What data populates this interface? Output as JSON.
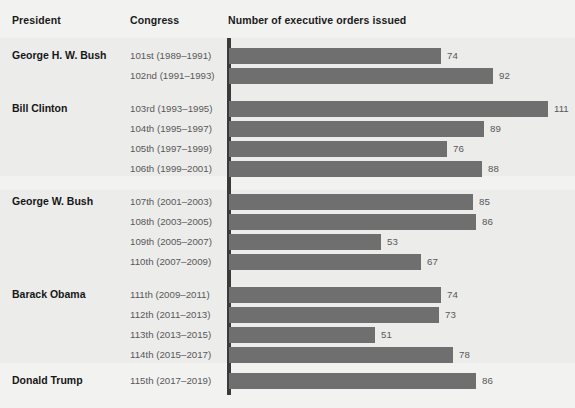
{
  "headers": {
    "president": "President",
    "congress": "Congress",
    "value": "Number of executive orders issued"
  },
  "chart_data": {
    "type": "bar",
    "orientation": "horizontal",
    "title": "Number of executive orders issued",
    "xlabel": "Number of executive orders issued",
    "ylabel": "Congress",
    "xlim": [
      0,
      120
    ],
    "grid": false,
    "legend": null,
    "bar_color": "#6f6f6f",
    "background_color": "#ececeb",
    "axis_color": "#3b3b3b",
    "categories": [
      "101st (1989–1991)",
      "102nd (1991–1993)",
      "103rd (1993–1995)",
      "104th (1995–1997)",
      "105th (1997–1999)",
      "106th (1999–2001)",
      "107th (2001–2003)",
      "108th (2003–2005)",
      "109th (2005–2007)",
      "110th (2007–2009)",
      "111th (2009–2011)",
      "112th (2011–2013)",
      "113th (2013–2015)",
      "114th (2015–2017)",
      "115th (2017–2019)"
    ],
    "values": [
      74,
      92,
      111,
      89,
      76,
      88,
      85,
      86,
      53,
      67,
      74,
      73,
      51,
      78,
      86
    ],
    "groups": [
      {
        "president": "George H. W. Bush",
        "congresses": [
          "101st (1989–1991)",
          "102nd (1991–1993)"
        ],
        "values": [
          74,
          92
        ]
      },
      {
        "president": "Bill Clinton",
        "congresses": [
          "103rd (1993–1995)",
          "104th (1995–1997)",
          "105th (1997–1999)",
          "106th (1999–2001)"
        ],
        "values": [
          111,
          89,
          76,
          88
        ]
      },
      {
        "president": "George W. Bush",
        "congresses": [
          "107th (2001–2003)",
          "108th (2003–2005)",
          "109th (2005–2007)",
          "110th (2007–2009)"
        ],
        "values": [
          85,
          86,
          53,
          67
        ]
      },
      {
        "president": "Barack Obama",
        "congresses": [
          "111th (2009–2011)",
          "112th (2011–2013)",
          "113th (2013–2015)",
          "114th (2015–2017)"
        ],
        "values": [
          74,
          73,
          51,
          78
        ]
      },
      {
        "president": "Donald Trump",
        "congresses": [
          "115th (2017–2019)"
        ],
        "values": [
          86
        ]
      }
    ]
  },
  "rows": [
    {
      "president": "George H. W. Bush",
      "congress": "101st (1989–1991)",
      "value": 74,
      "top": 46
    },
    {
      "president": "",
      "congress": "102nd (1991–1993)",
      "value": 92,
      "top": 66
    },
    {
      "president": "Bill Clinton",
      "congress": "103rd (1993–1995)",
      "value": 111,
      "top": 99
    },
    {
      "president": "",
      "congress": "104th (1995–1997)",
      "value": 89,
      "top": 119
    },
    {
      "president": "",
      "congress": "105th (1997–1999)",
      "value": 76,
      "top": 139
    },
    {
      "president": "",
      "congress": "106th (1999–2001)",
      "value": 88,
      "top": 159
    },
    {
      "president": "George W. Bush",
      "congress": "107th (2001–2003)",
      "value": 85,
      "top": 192
    },
    {
      "president": "",
      "congress": "108th (2003–2005)",
      "value": 86,
      "top": 212
    },
    {
      "president": "",
      "congress": "109th (2005–2007)",
      "value": 53,
      "top": 232
    },
    {
      "president": "",
      "congress": "110th (2007–2009)",
      "value": 67,
      "top": 252
    },
    {
      "president": "Barack Obama",
      "congress": "111th (2009–2011)",
      "value": 74,
      "top": 285
    },
    {
      "president": "",
      "congress": "112th (2011–2013)",
      "value": 73,
      "top": 305
    },
    {
      "president": "",
      "congress": "113th (2013–2015)",
      "value": 51,
      "top": 325
    },
    {
      "president": "",
      "congress": "114th (2015–2017)",
      "value": 78,
      "top": 345
    },
    {
      "president": "Donald Trump",
      "congress": "115th (2017–2019)",
      "value": 86,
      "top": 371
    }
  ],
  "scale": {
    "origin_x": 229,
    "px_per_unit": 2.87,
    "label_gap": 6
  }
}
